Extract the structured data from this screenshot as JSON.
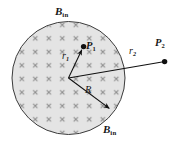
{
  "figure": {
    "canvas": {
      "width": 179,
      "height": 145,
      "background": "#ffffff"
    },
    "region": {
      "shape": "circle",
      "name": "field-region",
      "center_x": 68.5,
      "center_y": 78,
      "radius": 56.5,
      "fill": "#e3e3e3",
      "stroke": "#3a3a3a",
      "stroke_width": 1
    },
    "field_marker": {
      "glyph": "x",
      "meaning": "magnetic-field-into-page",
      "color": "#8c8c8c",
      "spacing": 13.5,
      "size": 4.2
    },
    "labels": {
      "b_in_top": {
        "text": "B",
        "sub": "in"
      },
      "b_in_bottom": {
        "text": "B",
        "sub": "in"
      },
      "p1": {
        "text": "P",
        "sub": "1"
      },
      "p2": {
        "text": "P",
        "sub": "2"
      },
      "r1": {
        "text": "r",
        "sub": "1"
      },
      "r2": {
        "text": "r",
        "sub": "2"
      },
      "radius": {
        "text": "R"
      }
    },
    "points": [
      {
        "name": "point-p1",
        "label": "P1",
        "x": 83.5,
        "y": 46.5,
        "radius": 2.6,
        "color": "#101010"
      },
      {
        "name": "point-p2",
        "label": "P2",
        "x": 164.5,
        "y": 61.5,
        "radius": 2.6,
        "color": "#101010"
      }
    ],
    "vectors": [
      {
        "name": "vector-r1",
        "label": "r1",
        "x1": 68.5,
        "y1": 78,
        "x2": 83.5,
        "y2": 46.5,
        "arrow": true,
        "color": "#101010"
      },
      {
        "name": "vector-r2",
        "label": "r2",
        "x1": 68.5,
        "y1": 78,
        "x2": 164.5,
        "y2": 61.5,
        "arrow": false,
        "color": "#101010"
      },
      {
        "name": "vector-radius",
        "label": "R",
        "x1": 68.5,
        "y1": 78,
        "x2": 111.5,
        "y2": 110,
        "arrow": true,
        "color": "#101010"
      }
    ]
  }
}
